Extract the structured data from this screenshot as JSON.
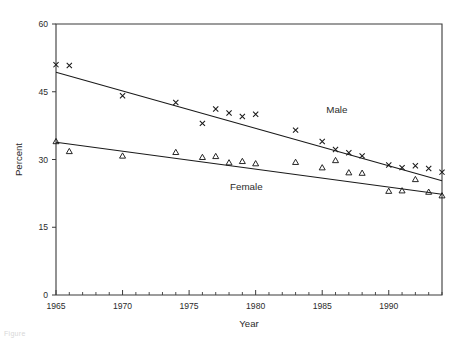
{
  "chart_data": {
    "type": "scatter",
    "title": "",
    "xlabel": "Year",
    "ylabel": "Percent",
    "xlim": [
      1965,
      1994
    ],
    "ylim": [
      0,
      60
    ],
    "ytick_labels": [
      "0",
      "15",
      "30",
      "45",
      "60"
    ],
    "ytick_values": [
      0,
      15,
      30,
      45,
      60
    ],
    "xtick_labels": [
      "1965",
      "1970",
      "1975",
      "1980",
      "1985",
      "1990"
    ],
    "xtick_values": [
      1965,
      1970,
      1975,
      1980,
      1985,
      1990
    ],
    "xtick_minor_step": 1,
    "grid": false,
    "legend": "inline-annotations",
    "series": [
      {
        "name": "Male",
        "label": "Male",
        "marker": "x",
        "annotation_x": 1986.1,
        "annotation_y": 40.2,
        "x": [
          1965,
          1966,
          1970,
          1974,
          1976,
          1977,
          1978,
          1979,
          1980,
          1983,
          1985,
          1986,
          1987,
          1988,
          1990,
          1991,
          1992,
          1993,
          1994
        ],
        "y": [
          51.0,
          50.8,
          44.1,
          42.6,
          38.0,
          41.2,
          40.3,
          39.5,
          40.0,
          36.5,
          34.0,
          32.2,
          31.5,
          30.8,
          28.8,
          28.2,
          28.6,
          28.0,
          27.2
        ],
        "fit": {
          "x1": 1965,
          "y1": 49.3,
          "x2": 1994,
          "y2": 25.3
        }
      },
      {
        "name": "Female",
        "label": "Female",
        "marker": "triangle",
        "annotation_x": 1979.3,
        "annotation_y": 23.3,
        "x": [
          1965,
          1966,
          1970,
          1974,
          1976,
          1977,
          1978,
          1979,
          1980,
          1983,
          1985,
          1986,
          1987,
          1988,
          1990,
          1991,
          1992,
          1993,
          1994
        ],
        "y": [
          34.0,
          31.8,
          30.8,
          31.6,
          30.5,
          30.7,
          29.3,
          29.6,
          29.1,
          29.4,
          28.2,
          29.8,
          27.1,
          27.0,
          23.0,
          23.1,
          25.6,
          22.8,
          22.0
        ],
        "fit": {
          "x1": 1965,
          "y1": 33.8,
          "x2": 1994,
          "y2": 22.3
        }
      }
    ]
  },
  "caption": {
    "text": "Figure"
  }
}
